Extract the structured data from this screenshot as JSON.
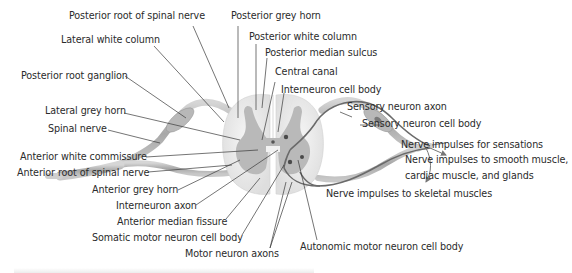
{
  "diagram": {
    "labels": {
      "posterior_root_spinal_nerve": "Posterior root of spinal nerve",
      "posterior_grey_horn": "Posterior grey horn",
      "lateral_white_column": "Lateral white column",
      "posterior_white_column": "Posterior white column",
      "posterior_median_sulcus": "Posterior median sulcus",
      "posterior_root_ganglion": "Posterior root ganglion",
      "central_canal": "Central canal",
      "interneuron_cell_body": "Interneuron cell body",
      "lateral_grey_horn": "Lateral grey horn",
      "sensory_neuron_axon": "Sensory neuron axon",
      "spinal_nerve": "Spinal nerve",
      "sensory_neuron_cell_body": "Sensory neuron cell body",
      "nerve_impulses_sensations": "Nerve impulses for sensations",
      "anterior_white_commissure": "Anterior white commissure",
      "nerve_impulses_smooth_line1": "Nerve impulses to smooth muscle,",
      "nerve_impulses_smooth_line2": "cardiac muscle, and glands",
      "anterior_root_spinal_nerve": "Anterior root of spinal nerve",
      "anterior_grey_horn": "Anterior grey horn",
      "nerve_impulses_skeletal": "Nerve impulses to skeletal muscles",
      "interneuron_axon": "Interneuron axon",
      "anterior_median_fissure": "Anterior median fissure",
      "somatic_motor_neuron_cell_body": "Somatic motor neuron cell body",
      "motor_neuron_axons": "Motor neuron axons",
      "autonomic_motor_neuron_cell_body": "Autonomic motor neuron cell body"
    },
    "colors": {
      "white_matter": "#ececec",
      "grey_matter": "#b9b9b9",
      "nerve": "#a9a9a9",
      "nerve_light": "#d2d2d2",
      "neuron": "#6e6e6e",
      "leader": "#3a3a3a",
      "text": "#2b2b2b"
    }
  }
}
